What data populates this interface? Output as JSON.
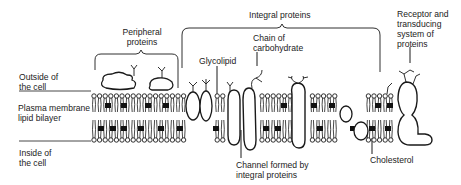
{
  "diagram": {
    "regions": {
      "outside": [
        "Outside of",
        "the cell"
      ],
      "bilayer": [
        "Plasma membrane",
        "lipid bilayer"
      ],
      "inside": [
        "Inside of",
        "the cell"
      ]
    },
    "labels": {
      "peripheral": [
        "Peripheral",
        "proteins"
      ],
      "integral": "Integral proteins",
      "glycolipid": "Glycolipid",
      "carbohydrate": [
        "Chain of",
        "carbohydrate"
      ],
      "receptor": [
        "Receptor and",
        "transducing",
        "system of",
        "proteins"
      ],
      "channel": [
        "Channel formed by",
        "integral proteins"
      ],
      "cholesterol": "Cholesterol"
    },
    "colors": {
      "line": "#1a1a1a",
      "cholesterol_fill": "#111111",
      "background": "#ffffff"
    }
  }
}
